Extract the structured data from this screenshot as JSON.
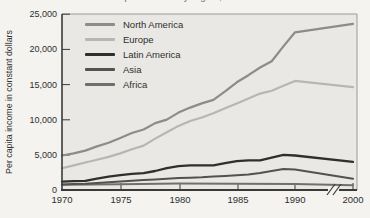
{
  "figure": {
    "clipped_title": "Per capita income by region, 1970–2000",
    "page_bg": "#f4f3f0",
    "plot_bg": "#e9e8e4",
    "axis_color": "#3a3a38",
    "frame_color": "#9a9a96"
  },
  "chart_data": {
    "type": "line",
    "title": "Per capita income by region, 1970–2000",
    "title_note_visible": "title is cut off at top edge of image",
    "xlabel": "",
    "ylabel": "Per capita income in constant dollars",
    "x_tick_labels": [
      "1970",
      "1975",
      "1980",
      "1985",
      "1990",
      "2000"
    ],
    "y_tick_labels": [
      "0",
      "5,000",
      "10,000",
      "15,000",
      "20,000",
      "25,000"
    ],
    "ylim": [
      0,
      25000
    ],
    "x_axis_break_between": [
      "1990",
      "2000"
    ],
    "grid": false,
    "legend_position": "top-left-inside",
    "series": [
      {
        "name": "North America",
        "color": "#8c8c8a",
        "width": 2.2,
        "points": [
          [
            1970,
            4900
          ],
          [
            1971,
            5200
          ],
          [
            1972,
            5600
          ],
          [
            1973,
            6200
          ],
          [
            1974,
            6700
          ],
          [
            1975,
            7400
          ],
          [
            1976,
            8100
          ],
          [
            1977,
            8600
          ],
          [
            1978,
            9500
          ],
          [
            1979,
            10000
          ],
          [
            1980,
            11000
          ],
          [
            1981,
            11700
          ],
          [
            1982,
            12300
          ],
          [
            1983,
            12800
          ],
          [
            1984,
            14000
          ],
          [
            1985,
            15300
          ],
          [
            1986,
            16300
          ],
          [
            1987,
            17400
          ],
          [
            1988,
            18300
          ],
          [
            1989,
            20400
          ],
          [
            1990,
            22400
          ],
          [
            2000,
            23600
          ]
        ]
      },
      {
        "name": "Europe",
        "color": "#b7b6b2",
        "width": 2.2,
        "points": [
          [
            1970,
            3100
          ],
          [
            1971,
            3500
          ],
          [
            1972,
            3900
          ],
          [
            1973,
            4300
          ],
          [
            1974,
            4700
          ],
          [
            1975,
            5200
          ],
          [
            1976,
            5800
          ],
          [
            1977,
            6300
          ],
          [
            1978,
            7300
          ],
          [
            1979,
            8200
          ],
          [
            1980,
            9100
          ],
          [
            1981,
            9800
          ],
          [
            1982,
            10300
          ],
          [
            1983,
            10900
          ],
          [
            1984,
            11600
          ],
          [
            1985,
            12300
          ],
          [
            1986,
            13000
          ],
          [
            1987,
            13700
          ],
          [
            1988,
            14100
          ],
          [
            1989,
            14800
          ],
          [
            1990,
            15500
          ],
          [
            2000,
            14600
          ]
        ]
      },
      {
        "name": "Latin America",
        "color": "#2f2f2d",
        "width": 2.3,
        "points": [
          [
            1970,
            1200
          ],
          [
            1971,
            1250
          ],
          [
            1972,
            1300
          ],
          [
            1973,
            1600
          ],
          [
            1974,
            1900
          ],
          [
            1975,
            2100
          ],
          [
            1976,
            2300
          ],
          [
            1977,
            2400
          ],
          [
            1978,
            2700
          ],
          [
            1979,
            3100
          ],
          [
            1980,
            3400
          ],
          [
            1981,
            3500
          ],
          [
            1982,
            3500
          ],
          [
            1983,
            3500
          ],
          [
            1984,
            3800
          ],
          [
            1985,
            4100
          ],
          [
            1986,
            4200
          ],
          [
            1987,
            4200
          ],
          [
            1988,
            4600
          ],
          [
            1989,
            5000
          ],
          [
            1990,
            4900
          ],
          [
            2000,
            4000
          ]
        ]
      },
      {
        "name": "Asia",
        "color": "#525250",
        "width": 2,
        "points": [
          [
            1970,
            800
          ],
          [
            1971,
            850
          ],
          [
            1972,
            900
          ],
          [
            1973,
            1000
          ],
          [
            1974,
            1100
          ],
          [
            1975,
            1200
          ],
          [
            1976,
            1300
          ],
          [
            1977,
            1400
          ],
          [
            1978,
            1500
          ],
          [
            1979,
            1600
          ],
          [
            1980,
            1700
          ],
          [
            1981,
            1750
          ],
          [
            1982,
            1800
          ],
          [
            1983,
            1900
          ],
          [
            1984,
            2000
          ],
          [
            1985,
            2100
          ],
          [
            1986,
            2200
          ],
          [
            1987,
            2400
          ],
          [
            1988,
            2700
          ],
          [
            1989,
            3000
          ],
          [
            1990,
            2900
          ],
          [
            2000,
            1600
          ]
        ]
      },
      {
        "name": "Africa",
        "color": "#6f6f6d",
        "width": 2,
        "points": [
          [
            1970,
            750
          ],
          [
            1975,
            820
          ],
          [
            1980,
            920
          ],
          [
            1985,
            900
          ],
          [
            1990,
            870
          ],
          [
            2000,
            680
          ]
        ]
      }
    ]
  }
}
